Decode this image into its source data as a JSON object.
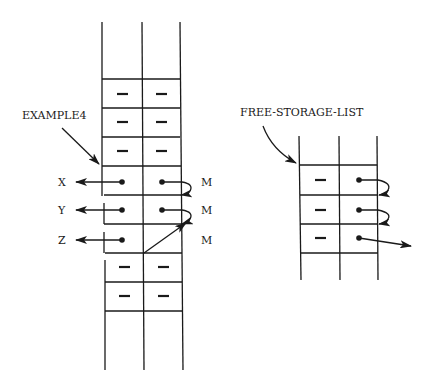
{
  "diagram": {
    "left_structure": {
      "name_label": "EXAMPLE4",
      "empty_cell_symbol": "–",
      "rows_above": 3,
      "pointer_rows": [
        {
          "car_target": "X",
          "cdr_target": "M"
        },
        {
          "car_target": "Y",
          "cdr_target": "M"
        },
        {
          "car_target": "Z",
          "cdr_target": "M"
        }
      ],
      "rows_below": 2
    },
    "right_structure": {
      "name_label": "FREE-STORAGE-LIST",
      "empty_cell_symbol": "–",
      "rows": 3
    },
    "colors": {
      "ink": "#1a1a1a",
      "background": "#ffffff"
    }
  }
}
